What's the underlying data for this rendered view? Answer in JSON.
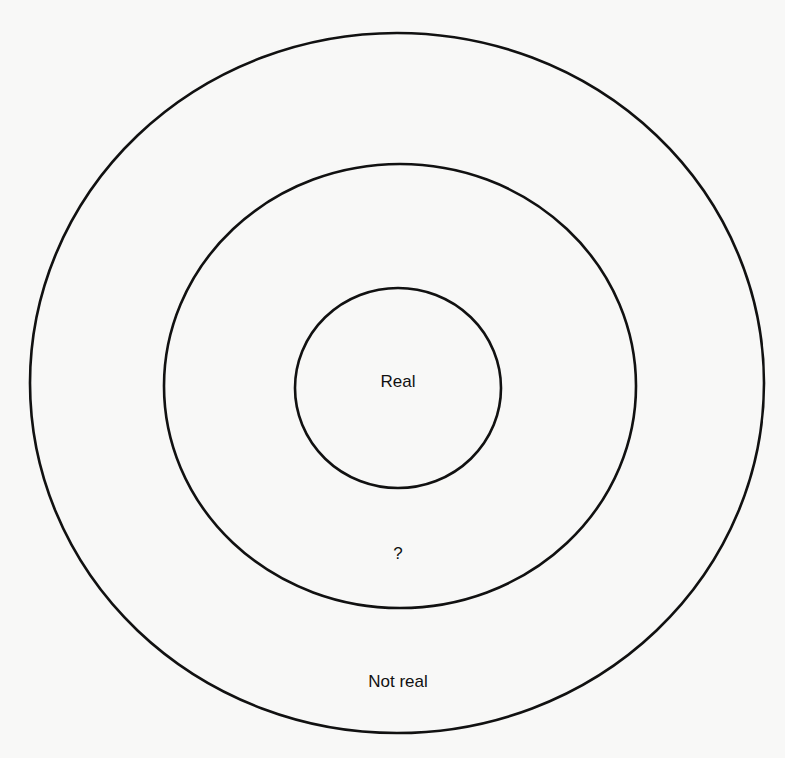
{
  "diagram": {
    "type": "concentric-circles",
    "stroke_color": "#111111",
    "background_color": "#f8f8f7",
    "rings": [
      {
        "name": "outer",
        "cx": 397,
        "cy": 383,
        "rx": 367,
        "ry": 350,
        "label": "Not real",
        "label_x": 398,
        "label_y": 681
      },
      {
        "name": "middle",
        "cx": 400,
        "cy": 386,
        "rx": 236,
        "ry": 222,
        "label": "?",
        "label_x": 398,
        "label_y": 553
      },
      {
        "name": "inner",
        "cx": 398,
        "cy": 388,
        "rx": 103,
        "ry": 100,
        "label": "Real",
        "label_x": 398,
        "label_y": 381
      }
    ]
  }
}
